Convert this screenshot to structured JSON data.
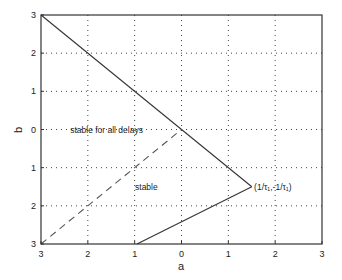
{
  "chart_data": {
    "type": "line",
    "title": "",
    "xlabel": "a",
    "ylabel": "b",
    "xlim": [
      -3,
      3
    ],
    "ylim": [
      -3,
      3
    ],
    "x_ticks": [
      -3,
      -2,
      -1,
      0,
      1,
      2,
      3
    ],
    "x_tick_labels": [
      "3",
      "2",
      "1",
      "0",
      "1",
      "2",
      "3"
    ],
    "y_ticks": [
      3,
      2,
      1,
      0,
      -1,
      -2,
      -3
    ],
    "y_tick_labels": [
      "3",
      "2",
      "1",
      "0",
      "1",
      "2",
      "3"
    ],
    "grid": true,
    "series": [
      {
        "name": "upper boundary",
        "style": "solid",
        "points": [
          [
            -3,
            3
          ],
          [
            1.5,
            -1.5
          ]
        ]
      },
      {
        "name": "lower boundary",
        "style": "solid",
        "points": [
          [
            1.5,
            -1.5
          ],
          [
            -0.95,
            -3
          ]
        ]
      },
      {
        "name": "delay-independent boundary",
        "style": "dashed",
        "points": [
          [
            -3,
            -3
          ],
          [
            0,
            0
          ]
        ]
      }
    ],
    "annotations": [
      {
        "text": "stable for all delays",
        "x": -1.6,
        "y": 0
      },
      {
        "text": "stable",
        "x": -0.75,
        "y": -1.5
      },
      {
        "text": "(1/τ₁,-1/τ₁)",
        "x": 1.55,
        "y": -1.5
      }
    ]
  }
}
